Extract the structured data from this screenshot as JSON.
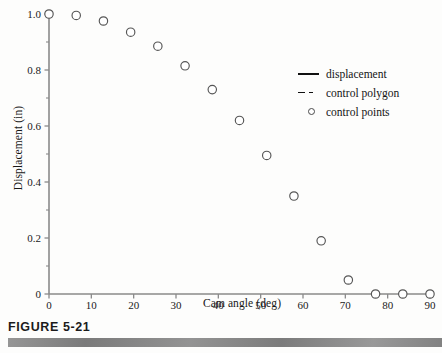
{
  "figure": {
    "caption": "FIGURE 5-21",
    "caption_bar_color": "#7d7d7d"
  },
  "chart_data": {
    "type": "scatter",
    "title": "",
    "xlabel": "Cam angle (deg)",
    "ylabel": "Displacement (in)",
    "xlim": [
      0,
      90
    ],
    "ylim": [
      0,
      1.0
    ],
    "xticks": [
      0,
      10,
      20,
      30,
      40,
      50,
      60,
      70,
      80,
      90
    ],
    "xticklabels": [
      "0",
      "10",
      "20",
      "30",
      "40",
      "50",
      "60",
      "70",
      "80",
      "90"
    ],
    "yticks": [
      0,
      0.2,
      0.4,
      0.6,
      0.8,
      1.0
    ],
    "yticklabels": [
      "0",
      "0.2",
      "0.4",
      "0.6",
      "0.8",
      "1.0"
    ],
    "yminorticks": [
      0.1,
      0.3,
      0.5,
      0.7,
      0.9
    ],
    "grid": false,
    "legend_position": "center right",
    "marker": "open-circle",
    "marker_color": "#555555",
    "series": [
      {
        "name": "control points",
        "x": [
          0,
          6.43,
          12.86,
          19.29,
          25.71,
          32.14,
          38.57,
          45.0,
          51.43,
          57.86,
          64.29,
          70.71,
          77.14,
          83.57,
          90.0
        ],
        "y": [
          1.0,
          0.995,
          0.975,
          0.935,
          0.885,
          0.815,
          0.73,
          0.62,
          0.495,
          0.35,
          0.19,
          0.05,
          0.0,
          0.0,
          0.0
        ]
      }
    ],
    "legend": [
      {
        "label": "displacement",
        "key": "solid-line"
      },
      {
        "label": "control polygon",
        "key": "dashed-line"
      },
      {
        "label": "control points",
        "key": "open-circle"
      }
    ]
  }
}
